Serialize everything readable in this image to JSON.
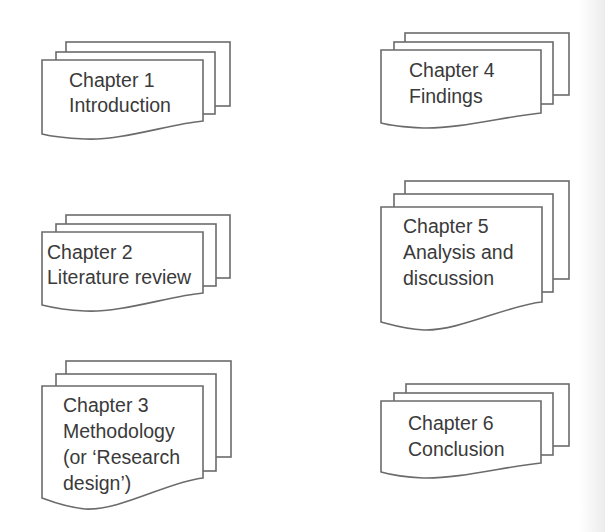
{
  "diagram": {
    "type": "document-stack-layout",
    "colors": {
      "background": "#ffffff",
      "stroke": "#6b6b6b",
      "text": "#3a3a3a"
    },
    "chapters": [
      {
        "number": "Chapter 1",
        "lines": [
          "Chapter 1",
          "Introduction"
        ]
      },
      {
        "number": "Chapter 2",
        "lines": [
          "Chapter 2",
          "Literature review"
        ]
      },
      {
        "number": "Chapter 3",
        "lines": [
          "Chapter 3",
          "Methodology",
          "(or ‘Research",
          "design’)"
        ]
      },
      {
        "number": "Chapter 4",
        "lines": [
          "Chapter 4",
          "Findings"
        ]
      },
      {
        "number": "Chapter 5",
        "lines": [
          "Chapter 5",
          "Analysis and",
          "discussion"
        ]
      },
      {
        "number": "Chapter 6",
        "lines": [
          "Chapter 6",
          "Conclusion"
        ]
      }
    ]
  }
}
